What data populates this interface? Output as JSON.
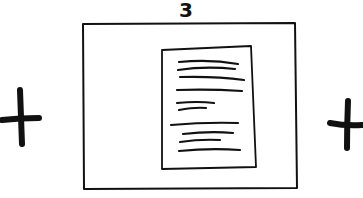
{
  "sketch": {
    "frame_label": "3",
    "left_control": {
      "icon": "plus-icon"
    },
    "right_control": {
      "icon": "plus-icon"
    },
    "frame": {
      "content": "document-page",
      "text_lines": 10
    }
  },
  "colors": {
    "ink": "#111111",
    "background": "#ffffff"
  }
}
